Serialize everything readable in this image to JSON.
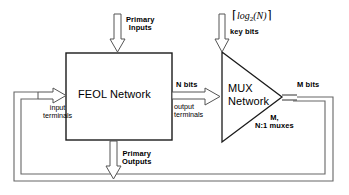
{
  "diagram": {
    "blocks": {
      "feol": {
        "label": "FEOL Network",
        "shape": "rectangle"
      },
      "mux": {
        "label_line1": "MUX",
        "label_line2": "Network",
        "shape": "triangle-right",
        "annotation_line1": "M,",
        "annotation_line2": "N:1 muxes"
      }
    },
    "signals": {
      "primary_inputs": {
        "line1": "Primary",
        "line2": "Inputs"
      },
      "primary_outputs": {
        "line1": "Primary",
        "line2": "Outputs"
      },
      "key_bits": {
        "math_prefix": "⌈",
        "math_base": "log",
        "math_sub": "2",
        "math_arg": "(N)",
        "math_suffix": "⌉",
        "label": "key bits"
      },
      "input_terminals": {
        "line1": "input",
        "line2": "terminals"
      },
      "output_terminals": {
        "line1": "output",
        "line2": "terminals"
      },
      "n_bits": "N bits",
      "m_bits": "M bits"
    },
    "colors": {
      "stroke": "#1a1a1a",
      "feedback_stroke": "#555555",
      "arrow_stroke": "#333333",
      "fill": "#ffffff",
      "text": "#000000"
    }
  }
}
